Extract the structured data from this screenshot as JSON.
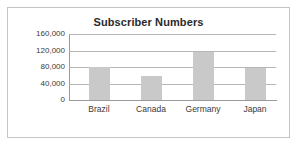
{
  "chart_data": {
    "type": "bar",
    "title": "Subscriber Numbers",
    "xlabel": "",
    "ylabel": "",
    "categories": [
      "Brazil",
      "Canada",
      "Germany",
      "Japan"
    ],
    "values": [
      80000,
      59000,
      117000,
      77000
    ],
    "series": [
      {
        "name": "Subscribers",
        "values": [
          80000,
          59000,
          117000,
          77000
        ]
      }
    ],
    "ylim": [
      0,
      160000
    ],
    "yticks": [
      0,
      40000,
      80000,
      120000,
      160000
    ],
    "ytick_labels": [
      "0",
      "40,000",
      "80,000",
      "120,000",
      "160,000"
    ],
    "grid": true,
    "legend": false,
    "colors": {
      "bar_fill": "#c9c9c9",
      "gridline": "#b7b7b7",
      "axis": "#9a9a9a",
      "border": "#c4c4c4",
      "title_text": "#2b2b2b",
      "label_text": "#3a3a3a",
      "background": "#ffffff"
    }
  }
}
